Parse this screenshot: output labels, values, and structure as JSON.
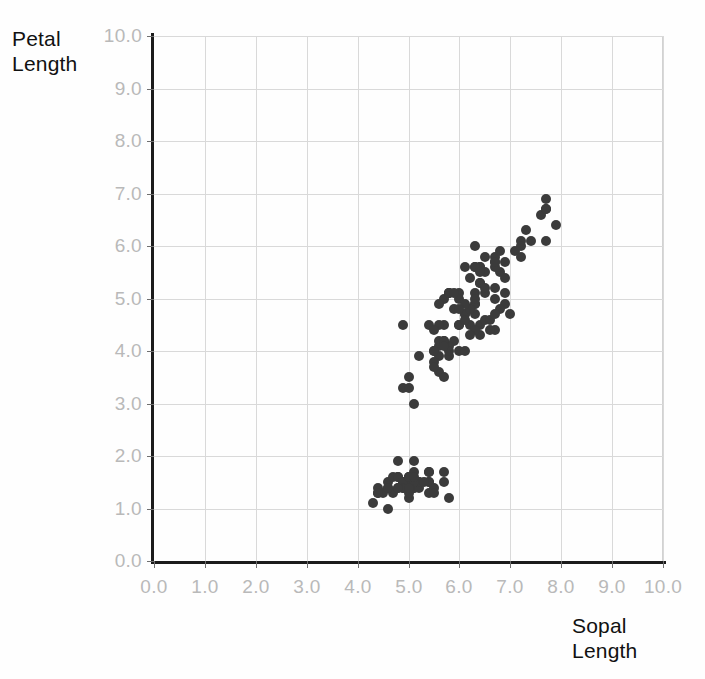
{
  "chart_data": {
    "type": "scatter",
    "title": "",
    "xlabel": "Sopal\nLength",
    "ylabel": "Petal\nLength",
    "xlim": [
      0.0,
      10.0
    ],
    "ylim": [
      0.0,
      10.0
    ],
    "grid": true,
    "legend": "none",
    "xticks": [
      "0.0",
      "1.0",
      "2.0",
      "3.0",
      "4.0",
      "5.0",
      "6.0",
      "7.0",
      "8.0",
      "9.0",
      "10.0"
    ],
    "yticks": [
      "0.0",
      "1.0",
      "2.0",
      "3.0",
      "4.0",
      "5.0",
      "6.0",
      "7.0",
      "8.0",
      "9.0",
      "10.0"
    ],
    "xtick_values": [
      0,
      1,
      2,
      3,
      4,
      5,
      6,
      7,
      8,
      9,
      10
    ],
    "ytick_values": [
      0,
      1,
      2,
      3,
      4,
      5,
      6,
      7,
      8,
      9,
      10
    ],
    "point_color": "#3b3b3b",
    "grid_color": "#d9d9d9",
    "axis_color": "#1b1b1b",
    "tick_label_color": "#b9b9b9",
    "series": [
      {
        "name": "iris",
        "x": [
          5.1,
          4.9,
          4.7,
          4.6,
          5.0,
          5.4,
          4.6,
          5.0,
          4.4,
          4.9,
          5.4,
          4.8,
          4.8,
          4.3,
          5.8,
          5.7,
          5.4,
          5.1,
          5.7,
          5.1,
          5.4,
          5.1,
          4.6,
          5.1,
          4.8,
          5.0,
          5.0,
          5.2,
          5.2,
          4.7,
          4.8,
          5.4,
          5.2,
          5.5,
          4.9,
          5.0,
          5.5,
          4.9,
          4.4,
          5.1,
          5.0,
          4.5,
          4.4,
          5.0,
          5.1,
          4.8,
          5.1,
          4.6,
          5.3,
          5.0,
          7.0,
          6.4,
          6.9,
          5.5,
          6.5,
          5.7,
          6.3,
          4.9,
          6.6,
          5.2,
          5.0,
          5.9,
          6.0,
          6.1,
          5.6,
          6.7,
          5.6,
          5.8,
          6.2,
          5.6,
          5.9,
          6.1,
          6.3,
          6.1,
          6.4,
          6.6,
          6.8,
          6.7,
          6.0,
          5.7,
          5.5,
          5.5,
          5.8,
          6.0,
          5.4,
          6.0,
          6.7,
          6.3,
          5.6,
          5.5,
          5.5,
          6.1,
          5.8,
          5.0,
          5.6,
          5.7,
          5.7,
          6.2,
          5.1,
          5.7,
          6.3,
          5.8,
          7.1,
          6.3,
          6.5,
          7.6,
          4.9,
          7.3,
          6.7,
          7.2,
          6.5,
          6.4,
          6.8,
          5.7,
          5.8,
          6.4,
          6.5,
          7.7,
          7.7,
          6.0,
          6.9,
          5.6,
          7.7,
          6.3,
          6.7,
          7.2,
          6.2,
          6.1,
          6.4,
          7.2,
          7.4,
          7.9,
          6.4,
          6.3,
          6.1,
          7.7,
          6.3,
          6.4,
          6.0,
          6.9,
          6.7,
          6.9,
          5.8,
          6.8,
          6.7,
          6.7,
          6.3,
          6.5,
          6.2,
          5.9
        ],
        "y": [
          1.4,
          1.4,
          1.3,
          1.5,
          1.4,
          1.7,
          1.4,
          1.5,
          1.4,
          1.5,
          1.5,
          1.6,
          1.4,
          1.1,
          1.2,
          1.5,
          1.3,
          1.4,
          1.7,
          1.5,
          1.7,
          1.5,
          1.0,
          1.7,
          1.9,
          1.6,
          1.6,
          1.5,
          1.4,
          1.6,
          1.6,
          1.5,
          1.5,
          1.4,
          1.5,
          1.2,
          1.3,
          1.4,
          1.3,
          1.5,
          1.3,
          1.3,
          1.3,
          1.6,
          1.9,
          1.4,
          1.6,
          1.4,
          1.5,
          1.4,
          4.7,
          4.5,
          4.9,
          4.0,
          4.6,
          4.5,
          4.7,
          3.3,
          4.6,
          3.9,
          3.5,
          4.2,
          4.0,
          4.7,
          3.6,
          4.4,
          4.5,
          4.1,
          4.5,
          3.9,
          4.8,
          4.0,
          4.9,
          4.7,
          4.3,
          4.4,
          4.8,
          5.0,
          4.5,
          3.5,
          3.8,
          3.7,
          3.9,
          5.1,
          4.5,
          4.5,
          4.7,
          4.4,
          4.1,
          4.0,
          4.4,
          4.6,
          4.0,
          3.3,
          4.2,
          4.2,
          4.2,
          4.3,
          3.0,
          4.1,
          6.0,
          5.1,
          5.9,
          5.6,
          5.8,
          6.6,
          4.5,
          6.3,
          5.8,
          6.1,
          5.1,
          5.3,
          5.5,
          5.0,
          5.1,
          5.3,
          5.5,
          6.7,
          6.9,
          5.0,
          5.7,
          4.9,
          6.7,
          4.9,
          5.7,
          6.0,
          4.8,
          4.9,
          5.6,
          5.8,
          6.1,
          6.4,
          5.6,
          5.1,
          5.6,
          6.1,
          5.6,
          5.5,
          4.8,
          5.4,
          5.6,
          5.1,
          5.1,
          5.9,
          5.7,
          5.2,
          5.0,
          5.2,
          5.4,
          5.1
        ]
      }
    ]
  }
}
